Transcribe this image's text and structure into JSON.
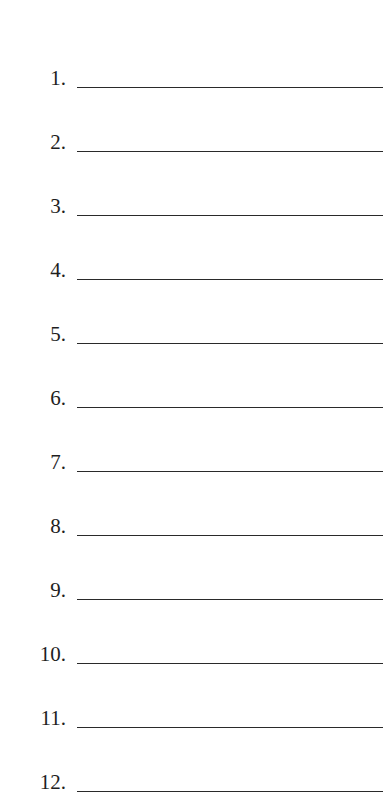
{
  "items": [
    {
      "label": "1.",
      "value": ""
    },
    {
      "label": "2.",
      "value": ""
    },
    {
      "label": "3.",
      "value": ""
    },
    {
      "label": "4.",
      "value": ""
    },
    {
      "label": "5.",
      "value": ""
    },
    {
      "label": "6.",
      "value": ""
    },
    {
      "label": "7.",
      "value": ""
    },
    {
      "label": "8.",
      "value": ""
    },
    {
      "label": "9.",
      "value": ""
    },
    {
      "label": "10.",
      "value": ""
    },
    {
      "label": "11.",
      "value": ""
    },
    {
      "label": "12.",
      "value": ""
    }
  ]
}
